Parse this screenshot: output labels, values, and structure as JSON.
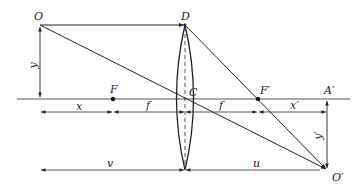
{
  "diagram": {
    "type": "thin-lens-ray-diagram",
    "points": {
      "object_top": "O",
      "lens_top": "D",
      "front_focus": "F",
      "lens_center": "C",
      "back_focus": "F′",
      "image_foot": "A′",
      "image_tip": "O′"
    },
    "dimensions": {
      "object_height": "y",
      "object_to_focus": "x",
      "focal_length_front": "f",
      "focal_length_back": "f",
      "focus_to_image": "x′",
      "image_height": "y′",
      "object_distance": "v",
      "image_distance": "u"
    },
    "colors": {
      "line": "#2a2a2a",
      "axis": "#555555",
      "background": "#ffffff"
    }
  }
}
